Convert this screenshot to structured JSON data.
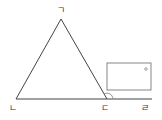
{
  "diagram": {
    "type": "geometry",
    "labels": {
      "apex": "ㄱ",
      "bottom_left": "ㄴ",
      "bottom_right": "ㄷ",
      "extension_end": "ㄹ"
    },
    "colors": {
      "line": "#444444",
      "box_border": "#666666",
      "arc": "#777777"
    },
    "answer_box": {
      "marker": "small-circle"
    }
  }
}
